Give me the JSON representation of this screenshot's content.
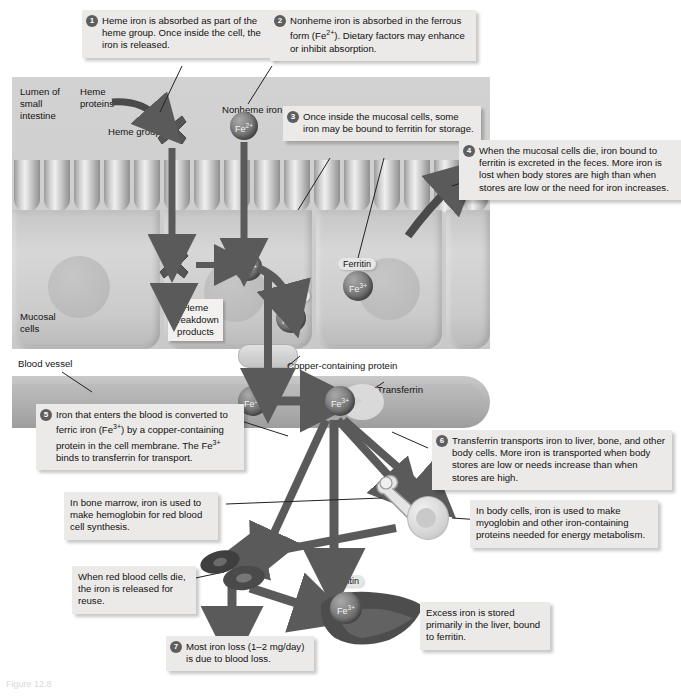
{
  "figure": {
    "caption": "Figure 12.8"
  },
  "panel_labels": {
    "lumen": "Lumen of\nsmall\nintestine",
    "heme_proteins": "Heme\nproteins",
    "heme_group": "Heme group",
    "nonheme_iron": "Nonheme iron",
    "mucosal_cells": "Mucosal\ncells",
    "heme_breakdown": "Heme\nbreakdown\nproducts",
    "blood_vessel": "Blood vessel",
    "copper_protein": "Copper-containing protein",
    "transferrin": "Transferrin",
    "ferritin": "Ferritin"
  },
  "molecules": {
    "fe2": "Fe2+",
    "fe3": "Fe3+",
    "fe_label_2": "Fe",
    "fe_sup_2": "2+",
    "fe_label_3": "Fe",
    "fe_sup_3": "3+"
  },
  "callouts": [
    {
      "id": "step-1",
      "number": "1",
      "text": "Heme iron is absorbed as part of the heme group. Once inside the cell, the iron is released."
    },
    {
      "id": "step-2",
      "number": "2",
      "text": "Nonheme iron is absorbed in the ferrous form (Fe2+). Dietary factors may enhance or inhibit absorption."
    },
    {
      "id": "step-3",
      "number": "3",
      "text": "Once inside the mucosal cells, some iron may be bound to ferritin for storage."
    },
    {
      "id": "step-4",
      "number": "4",
      "text": "When the mucosal cells die, iron bound to ferritin is excreted in the feces. More iron is lost when body stores are high than when stores are low or the need for iron increases."
    },
    {
      "id": "step-5",
      "number": "5",
      "text": "Iron that enters the blood is converted to ferric iron (Fe3+) by a copper-containing protein in the cell membrane. The Fe3+ binds to transferrin for transport."
    },
    {
      "id": "step-6",
      "number": "6",
      "text": "Transferrin transports iron to liver, bone, and other body cells. More iron is transported when body stores are low or needs increase than when stores are high."
    },
    {
      "id": "step-7",
      "number": "7",
      "text": "Most iron loss (1–2 mg/day) is due to blood loss."
    }
  ],
  "plain_callouts": [
    {
      "id": "bone-marrow",
      "text": "In bone marrow, iron is used to make hemoglobin for red blood cell synthesis."
    },
    {
      "id": "body-cells",
      "text": "In body cells, iron is used to make myoglobin and other iron-containing proteins needed for energy metabolism."
    },
    {
      "id": "rbc-death",
      "text": "When red blood cells die, the iron is released for reuse."
    },
    {
      "id": "liver-storage",
      "text": "Excess iron is stored primarily in the liver, bound to ferritin."
    }
  ],
  "colors": {
    "panel_grey": "#cfcfcf",
    "box_bg": "#eceae8",
    "arrow": "#5a5a5a",
    "badge": "#5e5e5e",
    "fe_sphere": "#6f6f6f"
  }
}
